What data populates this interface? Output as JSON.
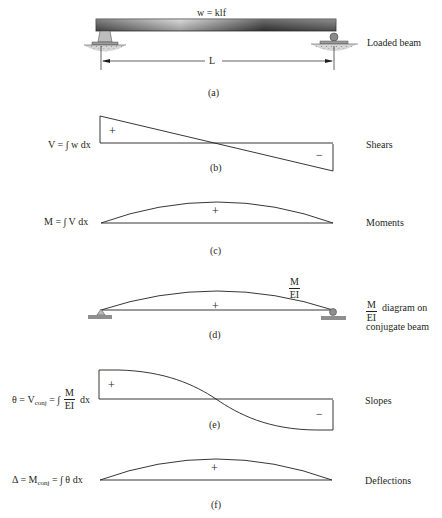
{
  "figure": {
    "panels": [
      {
        "id": "a",
        "caption": "(a)",
        "right_label": "Loaded beam",
        "load_label": "w = klf",
        "span_label": "L"
      },
      {
        "id": "b",
        "caption": "(b)",
        "right_label": "Shears",
        "equation": "V = ∫ w dx",
        "sign_pos": "+",
        "sign_neg": "−"
      },
      {
        "id": "c",
        "caption": "(c)",
        "right_label": "Moments",
        "equation": "M = ∫ V dx",
        "sign_pos": "+"
      },
      {
        "id": "d",
        "caption": "(d)",
        "right_label_frac_num": "M",
        "right_label_frac_den": "EI",
        "right_label_line1": "diagram on",
        "right_label_line2": "conjugate beam",
        "curve_label_num": "M",
        "curve_label_den": "EI",
        "sign_pos": "+"
      },
      {
        "id": "e",
        "caption": "(e)",
        "right_label": "Slopes",
        "eq_prefix": "θ = V",
        "eq_sub": "conj",
        "eq_mid": " = ∫",
        "eq_frac_num": "M",
        "eq_frac_den": "EI",
        "eq_suffix": "dx",
        "sign_pos": "+",
        "sign_neg": "−"
      },
      {
        "id": "f",
        "caption": "(f)",
        "right_label": "Deflections",
        "eq_prefix": "Δ = M",
        "eq_sub": "conj",
        "eq_suffix": " = ∫ θ dx",
        "sign_pos": "+"
      }
    ]
  },
  "colors": {
    "line": "#231f20",
    "beam_dark": "#4a4a4a",
    "beam_light": "#bdbdbd",
    "ground": "#c8c8c8",
    "support_fill": "#9a9a9a"
  }
}
